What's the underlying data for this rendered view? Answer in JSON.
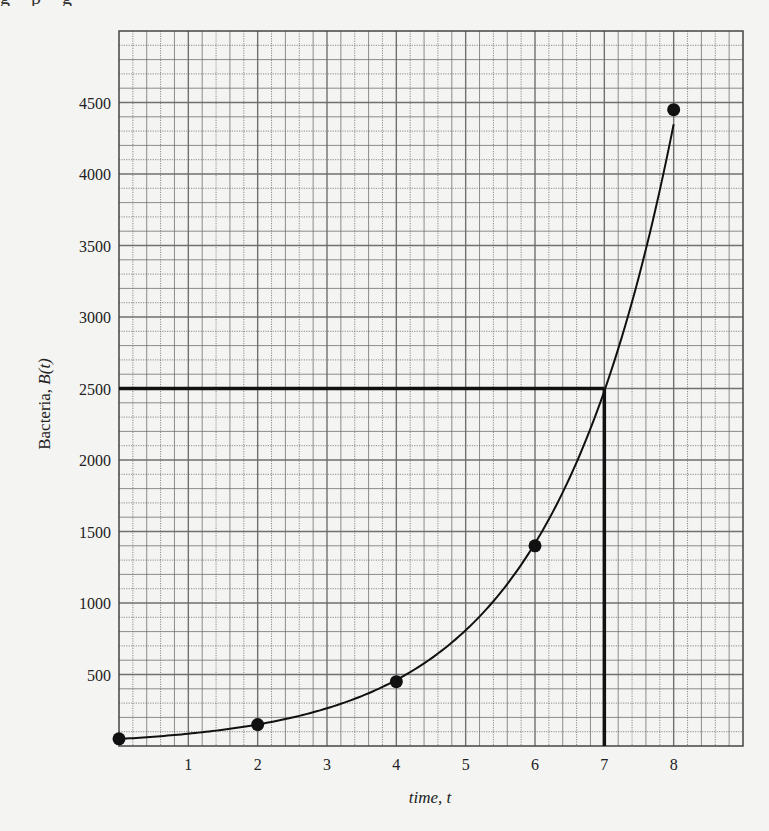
{
  "page": {
    "top_cut_text": "g p g"
  },
  "chart_data": {
    "type": "line",
    "title": "",
    "xlabel": "time, t",
    "ylabel_prefix": "Bacteria, ",
    "ylabel_italic": "B(t)",
    "xlim": [
      0,
      9
    ],
    "ylim": [
      0,
      5000
    ],
    "x_ticks": [
      1,
      2,
      3,
      4,
      5,
      6,
      7,
      8
    ],
    "y_ticks": [
      500,
      1000,
      1500,
      2000,
      2500,
      3000,
      3500,
      4000,
      4500
    ],
    "minor_x_step": 0.2,
    "minor_y_step": 100,
    "grid": true,
    "legend": null,
    "series": [
      {
        "name": "B(t) data points",
        "style": "markers",
        "x": [
          0,
          2,
          4,
          6,
          8
        ],
        "y": [
          50,
          150,
          450,
          1400,
          4450
        ]
      },
      {
        "name": "B(t) fitted curve",
        "style": "smooth-line",
        "model": "exponential",
        "approx_formula": "B(t) ≈ 50·e^(0.56t)",
        "x": [
          0,
          1,
          2,
          3,
          4,
          5,
          6,
          7,
          8
        ],
        "y": [
          50,
          88,
          150,
          270,
          450,
          820,
          1400,
          2500,
          4450
        ]
      }
    ],
    "annotations": [
      {
        "type": "hline",
        "y": 2500,
        "x_from": 0,
        "x_to": 7,
        "style": "bold"
      },
      {
        "type": "vline",
        "x": 7,
        "y_from": 0,
        "y_to": 2500,
        "style": "bold"
      }
    ],
    "colors": {
      "background": "#f4f4f2",
      "grid": "#6a6a6a",
      "curve": "#111111",
      "markers": "#111111",
      "annotation": "#111111"
    }
  }
}
